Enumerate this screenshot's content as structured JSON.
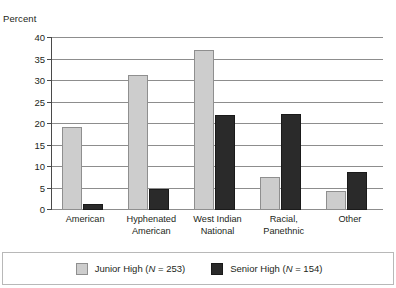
{
  "chart_data": {
    "type": "bar",
    "title": "",
    "xlabel": "",
    "ylabel": "Percent",
    "ylim": [
      0,
      40
    ],
    "yticks": [
      0,
      5,
      10,
      15,
      20,
      25,
      30,
      35,
      40
    ],
    "grid": true,
    "legend_position": "bottom",
    "categories": [
      "American",
      "Hyphenated American",
      "West Indian National",
      "Racial, Panethnic",
      "Other"
    ],
    "category_lines": [
      [
        "American"
      ],
      [
        "Hyphenated",
        "American"
      ],
      [
        "West Indian",
        "National"
      ],
      [
        "Racial,",
        "Panethnic"
      ],
      [
        "Other"
      ]
    ],
    "series": [
      {
        "name": "Junior High (N = 253)",
        "color": "#cdcdcd",
        "values": [
          19.3,
          31.5,
          37.3,
          7.7,
          4.4
        ]
      },
      {
        "name": "Senior High (N = 154)",
        "color": "#2a2a2a",
        "values": [
          1.5,
          4.9,
          22.0,
          22.4,
          8.8
        ]
      }
    ]
  },
  "axis": {
    "y_title": "Percent",
    "y_tick_labels": [
      "0",
      "5",
      "10",
      "15",
      "20",
      "25",
      "30",
      "35",
      "40"
    ]
  },
  "legend": {
    "items": [
      {
        "label_prefix": "Junior High (",
        "label_italic": "N",
        "label_suffix": " = 253)",
        "full": "Junior High (N = 253)",
        "color": "#cdcdcd"
      },
      {
        "label_prefix": "Senior High (",
        "label_italic": "N",
        "label_suffix": " = 154)",
        "full": "Senior High (N = 154)",
        "color": "#2a2a2a"
      }
    ]
  },
  "colors": {
    "junior_high": "#cdcdcd",
    "senior_high": "#2a2a2a",
    "gridline": "#8d8d8d",
    "axis": "#4a4a4a",
    "text": "#231f20"
  }
}
